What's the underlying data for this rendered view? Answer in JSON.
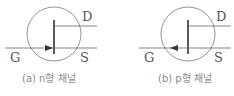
{
  "figures": [
    {
      "id": "a",
      "caption": "(a) n형 채널",
      "type": "n-channel JFET",
      "arrow_direction": "in",
      "labels": {
        "drain": "D",
        "gate": "G",
        "source": "S"
      }
    },
    {
      "id": "b",
      "caption": "(b) p형 채널",
      "type": "p-channel JFET",
      "arrow_direction": "out",
      "labels": {
        "drain": "D",
        "gate": "G",
        "source": "S"
      }
    }
  ],
  "colors": {
    "line": "#666666",
    "bar": "#333333",
    "text": "#555555",
    "caption": "#8a8a8a"
  }
}
